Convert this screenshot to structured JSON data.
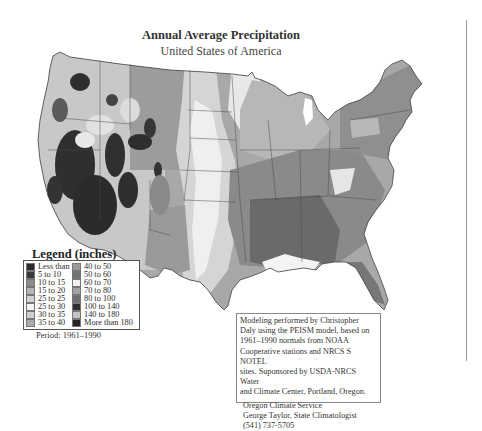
{
  "header": {
    "title": "Annual Average Precipitation",
    "subtitle": "United States of America"
  },
  "legend": {
    "title": "Legend (inches)",
    "period": "Period: 1961–1990",
    "items": [
      {
        "label": "Less than 5",
        "color": "#2b2b2b"
      },
      {
        "label": "5 to 10",
        "color": "#3a3a3a"
      },
      {
        "label": "10 to 15",
        "color": "#8a8a8a"
      },
      {
        "label": "15 to 20",
        "color": "#b5b5b5"
      },
      {
        "label": "25 to 25",
        "color": "#d2d2d2"
      },
      {
        "label": "25 to 30",
        "color": "#f4f4f4"
      },
      {
        "label": "30 to 35",
        "color": "#cfcfcf"
      },
      {
        "label": "35 to 40",
        "color": "#a9a9a9"
      },
      {
        "label": "40 to 50",
        "color": "#9a9a9a"
      },
      {
        "label": "50 to 60",
        "color": "#727272"
      },
      {
        "label": "60 to 70",
        "color": "#f0f0f0"
      },
      {
        "label": "70 to 80",
        "color": "#a2a2a2"
      },
      {
        "label": "80 to 100",
        "color": "#6e6e6e"
      },
      {
        "label": "100 to 140",
        "color": "#2e2e2e"
      },
      {
        "label": "140 to 180",
        "color": "#c4c4c4"
      },
      {
        "label": "More than 180",
        "color": "#262626"
      }
    ]
  },
  "info": {
    "lines": [
      "Modeling performed by Christopher",
      "Daly using the PEISM model, based on",
      "1961–1990 normals from NOAA",
      "Cooperative stations and NRCS S NOTEL",
      "sites. Suponsored by USDA-NRCS Water",
      "and Climate Center, Portland, Oregon."
    ],
    "credit": [
      "Oregon Climate Service",
      "George Taylor, State Climatologist",
      "(541) 737-5705"
    ]
  },
  "map": {
    "region": "Contiguous United States",
    "colors": {
      "arid_dark": "#2e2e2e",
      "plains_light": "#e6e6e6",
      "plains_mid": "#bdbdbd",
      "midwest": "#a8a8a8",
      "southeast": "#6f6f6f",
      "northeast": "#8c8c8c",
      "border": "#4a4a4a"
    }
  }
}
